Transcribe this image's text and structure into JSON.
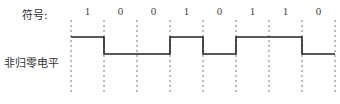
{
  "labels": {
    "symbol": "符号:",
    "encoding": "非归零电平"
  },
  "bits": [
    "1",
    "0",
    "0",
    "1",
    "0",
    "1",
    "1",
    "0"
  ],
  "layout": {
    "boundaries_x": [
      71,
      104,
      137,
      170,
      203,
      236,
      269,
      302,
      335
    ],
    "high_y": 37,
    "low_y": 54,
    "dash_top": 20,
    "dash_bottom": 92,
    "bit_label_y": 15
  },
  "colors": {
    "waveform": "#222222",
    "dashed": "#777777",
    "text": "#333333"
  }
}
